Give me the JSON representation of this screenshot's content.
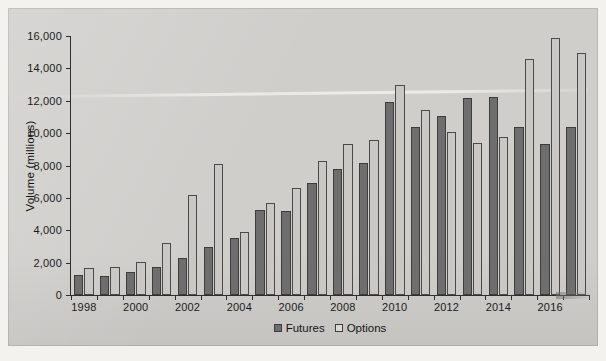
{
  "chart_data": {
    "type": "bar",
    "title": "",
    "xlabel": "",
    "ylabel": "Volume (millions)",
    "ylim": [
      0,
      16000
    ],
    "ytick_labels": [
      "0",
      "2,000",
      "4,000",
      "6,000",
      "8,000",
      "10,000",
      "12,000",
      "14,000",
      "16,000"
    ],
    "ytick_values": [
      0,
      2000,
      4000,
      6000,
      8000,
      10000,
      12000,
      14000,
      16000
    ],
    "grid": false,
    "legend_position": "bottom-center",
    "categories": [
      "1998",
      "1999",
      "2000",
      "2001",
      "2002",
      "2003",
      "2004",
      "2005",
      "2006",
      "2007",
      "2008",
      "2009",
      "2010",
      "2011",
      "2012",
      "2013",
      "2014",
      "2015",
      "2016",
      "2017"
    ],
    "xtick_labels": [
      "1998",
      "2000",
      "2002",
      "2004",
      "2006",
      "2008",
      "2010",
      "2012",
      "2014",
      "2016"
    ],
    "series": [
      {
        "name": "Futures",
        "color": "#6e6e6e",
        "values": [
          1250,
          1200,
          1400,
          1750,
          2300,
          2950,
          3500,
          5250,
          5200,
          6950,
          7800,
          8150,
          11950,
          10350,
          11050,
          12200,
          12250,
          10350,
          9350,
          10400
        ]
      },
      {
        "name": "Options",
        "color": "#c9c8c4",
        "values": [
          1650,
          1700,
          2050,
          3200,
          6150,
          8100,
          3900,
          5700,
          6600,
          8300,
          9350,
          9550,
          12950,
          11400,
          10100,
          9400,
          9750,
          14600,
          15900,
          14950
        ]
      }
    ]
  },
  "legend": {
    "items": [
      {
        "label": "Futures",
        "swatch": "futures-swatch"
      },
      {
        "label": "Options",
        "swatch": "options-swatch"
      }
    ]
  }
}
